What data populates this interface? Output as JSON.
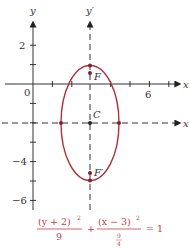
{
  "diagram": {
    "type": "ellipse-graph",
    "axes": {
      "x_label": "x",
      "y_label": "y",
      "y_prime_label": "y′",
      "x_prime_label": "x",
      "tick_labels": {
        "origin": "0",
        "x6": "6",
        "y2": "2",
        "ym4": "−4",
        "ym6": "−6"
      }
    },
    "points": {
      "center": "C",
      "focus": "F",
      "focus_prime": "F′"
    },
    "ellipse": {
      "center": [
        3,
        -2
      ],
      "semi_major_vertical": 3,
      "semi_minor_horizontal": 1.5,
      "color": "#b0303a"
    },
    "equation": {
      "num1": "(y + 2)",
      "exp1": "2",
      "den1": "9",
      "plus": "+",
      "num2": "(x − 3)",
      "exp2": "2",
      "den2_top": "9",
      "den2_bottom": "4",
      "equals": "= 1"
    }
  }
}
